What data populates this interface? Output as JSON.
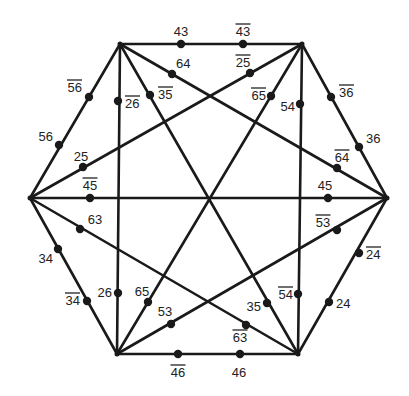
{
  "diagram": {
    "type": "hexagon-graph",
    "vertices": [
      {
        "id": "TL",
        "x": 120,
        "y": 44
      },
      {
        "id": "TR",
        "x": 302,
        "y": 44
      },
      {
        "id": "L",
        "x": 30,
        "y": 198
      },
      {
        "id": "R",
        "x": 387,
        "y": 198
      },
      {
        "id": "BL",
        "x": 117,
        "y": 354
      },
      {
        "id": "BR",
        "x": 298,
        "y": 354
      }
    ],
    "edges": [
      [
        "TL",
        "TR"
      ],
      [
        "TR",
        "R"
      ],
      [
        "R",
        "BR"
      ],
      [
        "BR",
        "BL"
      ],
      [
        "BL",
        "L"
      ],
      [
        "L",
        "TL"
      ],
      [
        "TL",
        "BL"
      ],
      [
        "TR",
        "BR"
      ],
      [
        "L",
        "R"
      ],
      [
        "TL",
        "BR"
      ],
      [
        "TR",
        "BL"
      ],
      [
        "TL",
        "R"
      ],
      [
        "TR",
        "L"
      ],
      [
        "L",
        "BR"
      ],
      [
        "R",
        "BL"
      ]
    ],
    "points": [
      {
        "label": "43",
        "overline": false,
        "x": 181,
        "y": 44,
        "lx": 181,
        "ly": 36,
        "anchor": "middle"
      },
      {
        "label": "43",
        "overline": true,
        "x": 243,
        "y": 44,
        "lx": 243,
        "ly": 36,
        "anchor": "middle"
      },
      {
        "label": "64",
        "overline": false,
        "x": 172,
        "y": 74,
        "lx": 176,
        "ly": 68,
        "anchor": "start"
      },
      {
        "label": "25",
        "overline": true,
        "x": 250,
        "y": 73,
        "lx": 243,
        "ly": 67,
        "anchor": "middle"
      },
      {
        "label": "35",
        "overline": true,
        "x": 150,
        "y": 95,
        "lx": 158,
        "ly": 99,
        "anchor": "start"
      },
      {
        "label": "65",
        "overline": true,
        "x": 271,
        "y": 96,
        "lx": 266,
        "ly": 100,
        "anchor": "end"
      },
      {
        "label": "26",
        "overline": true,
        "x": 118,
        "y": 101,
        "lx": 125,
        "ly": 108,
        "anchor": "start"
      },
      {
        "label": "54",
        "overline": false,
        "x": 300,
        "y": 104,
        "lx": 295,
        "ly": 111,
        "anchor": "end"
      },
      {
        "label": "56",
        "overline": true,
        "x": 89,
        "y": 97,
        "lx": 82,
        "ly": 92,
        "anchor": "end"
      },
      {
        "label": "56",
        "overline": false,
        "x": 59,
        "y": 145,
        "lx": 53,
        "ly": 141,
        "anchor": "end"
      },
      {
        "label": "36",
        "overline": true,
        "x": 331,
        "y": 97,
        "lx": 339,
        "ly": 97,
        "anchor": "start"
      },
      {
        "label": "36",
        "overline": false,
        "x": 359,
        "y": 147,
        "lx": 366,
        "ly": 143,
        "anchor": "start"
      },
      {
        "label": "25",
        "overline": false,
        "x": 83,
        "y": 167,
        "lx": 81,
        "ly": 161,
        "anchor": "middle"
      },
      {
        "label": "64",
        "overline": true,
        "x": 337,
        "y": 168,
        "lx": 342,
        "ly": 162,
        "anchor": "middle"
      },
      {
        "label": "45",
        "overline": true,
        "x": 90,
        "y": 198,
        "lx": 90,
        "ly": 190,
        "anchor": "middle"
      },
      {
        "label": "45",
        "overline": false,
        "x": 328,
        "y": 198,
        "lx": 325,
        "ly": 190,
        "anchor": "middle"
      },
      {
        "label": "63",
        "overline": false,
        "x": 80,
        "y": 229,
        "lx": 95,
        "ly": 224,
        "anchor": "middle"
      },
      {
        "label": "53",
        "overline": true,
        "x": 337,
        "y": 230,
        "lx": 323,
        "ly": 227,
        "anchor": "middle"
      },
      {
        "label": "34",
        "overline": false,
        "x": 58,
        "y": 249,
        "lx": 53,
        "ly": 263,
        "anchor": "end"
      },
      {
        "label": "24",
        "overline": true,
        "x": 359,
        "y": 253,
        "lx": 366,
        "ly": 259,
        "anchor": "start"
      },
      {
        "label": "34",
        "overline": true,
        "x": 87,
        "y": 301,
        "lx": 80,
        "ly": 305,
        "anchor": "end"
      },
      {
        "label": "26",
        "overline": false,
        "x": 118,
        "y": 293,
        "lx": 112,
        "ly": 297,
        "anchor": "end"
      },
      {
        "label": "65",
        "overline": false,
        "x": 148,
        "y": 302,
        "lx": 142,
        "ly": 296,
        "anchor": "middle"
      },
      {
        "label": "53",
        "overline": false,
        "x": 171,
        "y": 324,
        "lx": 165,
        "ly": 316,
        "anchor": "middle"
      },
      {
        "label": "35",
        "overline": false,
        "x": 267,
        "y": 303,
        "lx": 261,
        "ly": 311,
        "anchor": "end"
      },
      {
        "label": "54",
        "overline": true,
        "x": 298,
        "y": 294,
        "lx": 293,
        "ly": 299,
        "anchor": "end"
      },
      {
        "label": "24",
        "overline": false,
        "x": 329,
        "y": 302,
        "lx": 336,
        "ly": 308,
        "anchor": "start"
      },
      {
        "label": "63",
        "overline": true,
        "x": 246,
        "y": 325,
        "lx": 240,
        "ly": 342,
        "anchor": "middle"
      },
      {
        "label": "46",
        "overline": true,
        "x": 178,
        "y": 354,
        "lx": 178,
        "ly": 377,
        "anchor": "middle"
      },
      {
        "label": "46",
        "overline": false,
        "x": 240,
        "y": 354,
        "lx": 239,
        "ly": 377,
        "anchor": "middle"
      }
    ],
    "colors": {
      "line": "#1a1a1a",
      "background": "#ffffff"
    }
  }
}
